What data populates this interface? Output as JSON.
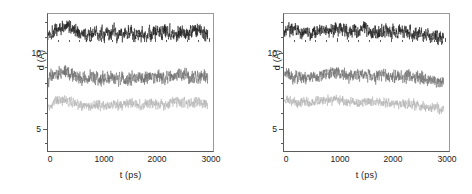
{
  "figure": {
    "panel_count": 2,
    "background": "#ffffff"
  },
  "axes": {
    "xlabel": "t (ps)",
    "ylabel": "d (Å)",
    "xticks": [
      "0",
      "1000",
      "2000",
      "3000"
    ],
    "yticks": [
      "10",
      "5"
    ]
  },
  "chart_data": [
    {
      "type": "line",
      "title": "",
      "xlabel": "t (ps)",
      "ylabel": "d (Å)",
      "xlim": [
        0,
        3100
      ],
      "ylim": [
        3.4,
        12.6
      ],
      "xticks": [
        0,
        1000,
        2000,
        3000
      ],
      "yticks": [
        5,
        10
      ],
      "grid": false,
      "legend": "none",
      "panel": "left",
      "series": [
        {
          "name": "distance-trace-1",
          "color": "#1a1a1a",
          "mean": 11.3,
          "noise": 0.45,
          "x": [
            0,
            100,
            200,
            300,
            400,
            500,
            600,
            700,
            800,
            900,
            1000,
            1100,
            1200,
            1300,
            1400,
            1500,
            1600,
            1700,
            1800,
            1900,
            2000,
            2100,
            2200,
            2300,
            2400,
            2500,
            2600,
            2700,
            2800,
            2900,
            3000
          ],
          "values": [
            11.2,
            11.5,
            11.6,
            11.7,
            11.8,
            11.6,
            11.3,
            11.2,
            11.2,
            11.3,
            11.3,
            11.2,
            11.3,
            11.3,
            11.2,
            11.3,
            11.4,
            11.3,
            11.2,
            11.2,
            11.3,
            11.4,
            11.5,
            11.4,
            11.3,
            11.5,
            11.3,
            11.4,
            11.5,
            11.4,
            11.3
          ]
        },
        {
          "name": "distance-trace-2",
          "color": "#6e6e6e",
          "mean": 8.3,
          "noise": 0.42,
          "x": [
            0,
            100,
            200,
            300,
            400,
            500,
            600,
            700,
            800,
            900,
            1000,
            1100,
            1200,
            1300,
            1400,
            1500,
            1600,
            1700,
            1800,
            1900,
            2000,
            2100,
            2200,
            2300,
            2400,
            2500,
            2600,
            2700,
            2800,
            2900,
            3000
          ],
          "values": [
            8.2,
            8.5,
            8.6,
            8.7,
            8.6,
            8.5,
            8.3,
            8.2,
            8.3,
            8.3,
            8.2,
            8.3,
            8.4,
            8.3,
            8.2,
            8.2,
            8.3,
            8.3,
            8.2,
            8.3,
            8.4,
            8.4,
            8.3,
            8.4,
            8.5,
            8.6,
            8.4,
            8.3,
            8.4,
            8.4,
            8.3
          ]
        },
        {
          "name": "distance-trace-3",
          "color": "#b4b4b4",
          "mean": 6.5,
          "noise": 0.32,
          "x": [
            0,
            100,
            200,
            300,
            400,
            500,
            600,
            700,
            800,
            900,
            1000,
            1100,
            1200,
            1300,
            1400,
            1500,
            1600,
            1700,
            1800,
            1900,
            2000,
            2100,
            2200,
            2300,
            2400,
            2500,
            2600,
            2700,
            2800,
            2900,
            3000
          ],
          "values": [
            6.3,
            6.7,
            6.8,
            6.8,
            6.7,
            6.6,
            6.5,
            6.5,
            6.4,
            6.5,
            6.5,
            6.4,
            6.5,
            6.5,
            6.4,
            6.5,
            6.6,
            6.5,
            6.5,
            6.6,
            6.6,
            6.6,
            6.5,
            6.6,
            6.7,
            6.7,
            6.6,
            6.6,
            6.7,
            6.6,
            6.5
          ]
        }
      ]
    },
    {
      "type": "line",
      "title": "",
      "xlabel": "t (ps)",
      "ylabel": "d (Å)",
      "xlim": [
        0,
        3100
      ],
      "ylim": [
        3.4,
        12.6
      ],
      "xticks": [
        0,
        1000,
        2000,
        3000
      ],
      "yticks": [
        5,
        10
      ],
      "grid": false,
      "legend": "none",
      "panel": "right",
      "series": [
        {
          "name": "distance-trace-1",
          "color": "#1a1a1a",
          "mean": 11.4,
          "noise": 0.42,
          "x": [
            0,
            100,
            200,
            300,
            400,
            500,
            600,
            700,
            800,
            900,
            1000,
            1100,
            1200,
            1300,
            1400,
            1500,
            1600,
            1700,
            1800,
            1900,
            2000,
            2100,
            2200,
            2300,
            2400,
            2500,
            2600,
            2700,
            2800,
            2900,
            3000
          ],
          "values": [
            11.5,
            11.6,
            11.5,
            11.4,
            11.4,
            11.3,
            11.4,
            11.5,
            11.5,
            11.5,
            11.6,
            11.5,
            11.4,
            11.5,
            11.5,
            11.6,
            11.5,
            11.4,
            11.5,
            11.5,
            11.4,
            11.4,
            11.5,
            11.4,
            11.3,
            11.3,
            11.2,
            11.2,
            11.1,
            11.1,
            11.0
          ]
        },
        {
          "name": "distance-trace-2",
          "color": "#6e6e6e",
          "mean": 8.4,
          "noise": 0.4,
          "x": [
            0,
            100,
            200,
            300,
            400,
            500,
            600,
            700,
            800,
            900,
            1000,
            1100,
            1200,
            1300,
            1400,
            1500,
            1600,
            1700,
            1800,
            1900,
            2000,
            2100,
            2200,
            2300,
            2400,
            2500,
            2600,
            2700,
            2800,
            2900,
            3000
          ],
          "values": [
            8.5,
            8.5,
            8.4,
            8.4,
            8.3,
            8.3,
            8.4,
            8.5,
            8.6,
            8.6,
            8.7,
            8.6,
            8.5,
            8.4,
            8.4,
            8.5,
            8.5,
            8.4,
            8.5,
            8.5,
            8.5,
            8.4,
            8.4,
            8.4,
            8.3,
            8.3,
            8.3,
            8.2,
            8.2,
            8.1,
            8.0
          ]
        },
        {
          "name": "distance-trace-3",
          "color": "#b4b4b4",
          "mean": 6.6,
          "noise": 0.3,
          "x": [
            0,
            100,
            200,
            300,
            400,
            500,
            600,
            700,
            800,
            900,
            1000,
            1100,
            1200,
            1300,
            1400,
            1500,
            1600,
            1700,
            1800,
            1900,
            2000,
            2100,
            2200,
            2300,
            2400,
            2500,
            2600,
            2700,
            2800,
            2900,
            3000
          ],
          "values": [
            6.8,
            6.8,
            6.7,
            6.7,
            6.6,
            6.6,
            6.7,
            6.8,
            6.8,
            6.8,
            6.9,
            6.8,
            6.7,
            6.7,
            6.6,
            6.7,
            6.7,
            6.7,
            6.7,
            6.7,
            6.6,
            6.6,
            6.6,
            6.6,
            6.5,
            6.5,
            6.4,
            6.3,
            6.3,
            6.2,
            6.1
          ]
        }
      ]
    }
  ]
}
